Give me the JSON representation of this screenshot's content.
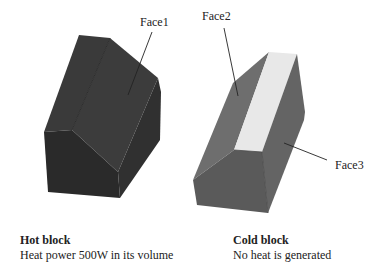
{
  "labels": {
    "face1": "Face1",
    "face2": "Face2",
    "face3": "Face3"
  },
  "hot_block": {
    "title": "Hot block",
    "description": "Heat power 500W in its volume"
  },
  "cold_block": {
    "title": "Cold block",
    "description": "No heat is generated"
  },
  "colors": {
    "hot_top": "#3b3b3b",
    "hot_side": "#333333",
    "hot_front": "#2a2a2a",
    "cold_face2": "#6f6f6f",
    "cold_face3": "#636363",
    "cold_top": "#e8e8e8",
    "cold_front": "#5a5a5a"
  }
}
